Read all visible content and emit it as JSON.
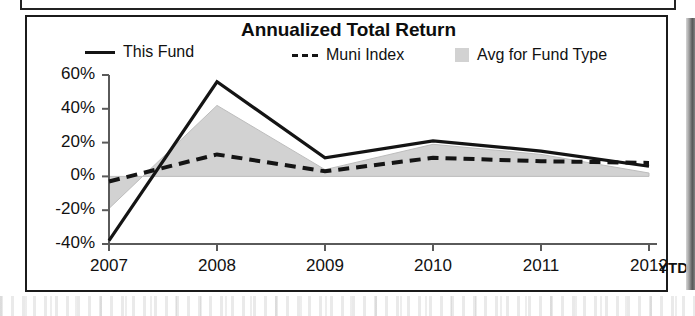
{
  "chart_data": {
    "type": "line",
    "title": "Annualized Total Return",
    "xlabel": "",
    "ylabel": "",
    "categories": [
      "2007",
      "2008",
      "2009",
      "2010",
      "2011",
      "2012"
    ],
    "x_axis_note": "YTD",
    "xtick_labels": [
      "2007",
      "2008",
      "2009",
      "2010",
      "2011",
      "2012"
    ],
    "ytick_labels": [
      "60%",
      "40%",
      "20%",
      "0%",
      "-20%",
      "-40%"
    ],
    "ytick_values": [
      60,
      40,
      20,
      0,
      -20,
      -40
    ],
    "ylim": [
      -40,
      60
    ],
    "grid": false,
    "legend_position": "top",
    "series": [
      {
        "name": "This Fund",
        "style": "solid",
        "color": "#141414",
        "values": [
          -38,
          56,
          11,
          21,
          15,
          6
        ]
      },
      {
        "name": "Muni Index",
        "style": "dashed",
        "color": "#141414",
        "values": [
          -3,
          13,
          3,
          11,
          9,
          8
        ]
      },
      {
        "name": "Avg for Fund Type",
        "style": "area",
        "color": "#d2d2d2",
        "values": [
          -19,
          42,
          4,
          19,
          13,
          2
        ]
      }
    ]
  },
  "chart": {
    "title": "Annualized Total Return",
    "legend": {
      "this_fund": "This Fund",
      "muni_index": "Muni Index",
      "avg_for_fund_type": "Avg for Fund Type"
    },
    "y_ticks": [
      "60%",
      "40%",
      "20%",
      "0%",
      "-20%",
      "-40%"
    ],
    "x_ticks": [
      "2007",
      "2008",
      "2009",
      "2010",
      "2011",
      "2012"
    ],
    "ytd_label": "YTD"
  },
  "colors": {
    "line": "#141414",
    "area_fill": "#d2d2d2",
    "axis": "#5a5a5a",
    "border": "#1b1b1b",
    "text": "#111111"
  }
}
